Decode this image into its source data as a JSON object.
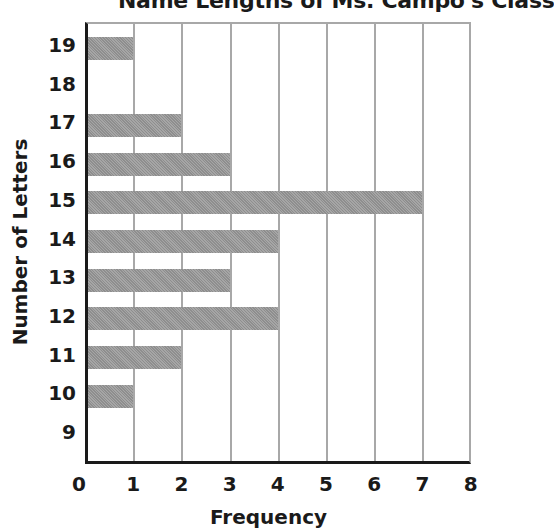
{
  "chart_data": {
    "type": "bar",
    "orientation": "horizontal",
    "title": "Name Lengths of Ms. Campo's Class",
    "xlabel": "Frequency",
    "ylabel": "Number of Letters",
    "categories": [
      "9",
      "10",
      "11",
      "12",
      "13",
      "14",
      "15",
      "16",
      "17",
      "18",
      "19"
    ],
    "values": [
      0,
      1,
      2,
      4,
      3,
      4,
      7,
      3,
      2,
      0,
      1
    ],
    "xlim": [
      0,
      8
    ],
    "x_ticks": [
      "0",
      "1",
      "2",
      "3",
      "4",
      "5",
      "6",
      "7",
      "8"
    ],
    "grid": "vertical",
    "bar_color": "#9a9a9a"
  }
}
